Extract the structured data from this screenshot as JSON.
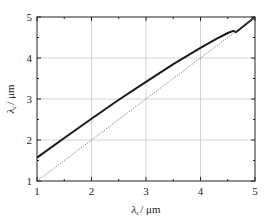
{
  "chart_data": {
    "type": "line",
    "title": "",
    "xlabel": "λ_c / μm",
    "ylabel": "λ_c / μm",
    "xlim": [
      1,
      5
    ],
    "ylim": [
      1,
      5
    ],
    "xticks": [
      "1",
      "2",
      "3",
      "4",
      "5"
    ],
    "yticks": [
      "1",
      "2",
      "3",
      "4",
      "5"
    ],
    "grid": true,
    "legend": null,
    "series": [
      {
        "name": "curve",
        "style": "solid-thick",
        "x": [
          1.0,
          1.5,
          2.0,
          2.5,
          3.0,
          3.5,
          4.0,
          4.3,
          4.5,
          4.6,
          4.65,
          5.0
        ],
        "y": [
          1.57,
          2.05,
          2.52,
          2.98,
          3.42,
          3.85,
          4.25,
          4.47,
          4.61,
          4.66,
          4.63,
          5.0
        ]
      },
      {
        "name": "reference y=x",
        "style": "dotted-thin",
        "x": [
          1,
          5
        ],
        "y": [
          1,
          5
        ]
      }
    ]
  },
  "labels": {
    "xlabel_main": "λ",
    "xlabel_sub": "c",
    "xlabel_unit": "/ μm",
    "ylabel_main": "λ",
    "ylabel_sub": "c",
    "ylabel_unit": "/ μm"
  }
}
